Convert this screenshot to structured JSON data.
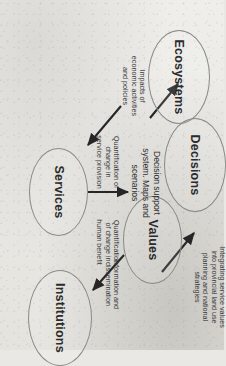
{
  "figure": {
    "type": "cycle-diagram",
    "orientation_degrees": 90,
    "background_hex": "#e9e8e4",
    "stroke_hex": "#8a8a86",
    "text_hex": "#2b2b2b"
  },
  "nodes": [
    {
      "id": "ecosystems",
      "label": "Ecosystems"
    },
    {
      "id": "services",
      "label": "Services"
    },
    {
      "id": "values",
      "label": "Values"
    },
    {
      "id": "institutions",
      "label": "Institutions"
    },
    {
      "id": "decisions",
      "label": "Decisions"
    }
  ],
  "edges": [
    {
      "id": "ecosystems-to-services",
      "from": "Ecosystems",
      "to": "Services",
      "label": "Quantification of\nchange in\nservice provision"
    },
    {
      "id": "services-to-values",
      "from": "Services",
      "to": "Values",
      "label": "Quantification\nof change in\nhuman benefit"
    },
    {
      "id": "values-to-institutions",
      "from": "Values",
      "to": "Institutions",
      "label": "Information and\ndissemination"
    },
    {
      "id": "institutions-to-decisions",
      "from": "Institutions",
      "to": "Decisions",
      "label": "Integrating service values\ninto provincial land use\nplanning and national\nstrategies"
    },
    {
      "id": "decisions-to-ecosystems",
      "from": "Decisions",
      "to": "Ecosystems",
      "label": "Impacts of\neconomic activities\nand policies"
    }
  ],
  "center": {
    "id": "decision-support",
    "label": "Decision support\nsystem. Maps and\nscenarios"
  }
}
